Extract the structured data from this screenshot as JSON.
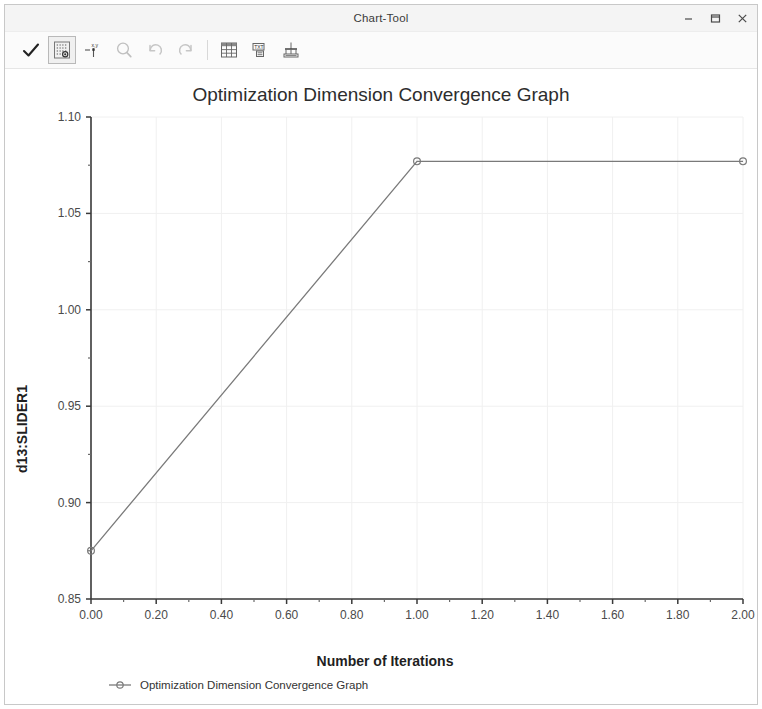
{
  "window": {
    "title": "Chart-Tool",
    "controls": [
      {
        "name": "minimize",
        "label": "–"
      },
      {
        "name": "maximize",
        "label": "❐"
      },
      {
        "name": "close",
        "label": "×"
      }
    ]
  },
  "toolbar": {
    "items": [
      {
        "name": "apply-check-icon",
        "tooltip": "Apply",
        "selected": false
      },
      {
        "name": "grid-points-icon",
        "tooltip": "Show Points",
        "selected": true
      },
      {
        "name": "xy-axes-icon",
        "tooltip": "X,Y Axes",
        "selected": false
      },
      {
        "name": "zoom-icon",
        "tooltip": "Zoom",
        "selected": false
      },
      {
        "name": "undo-icon",
        "tooltip": "Undo",
        "selected": false
      },
      {
        "name": "redo-icon",
        "tooltip": "Redo",
        "selected": false
      },
      {
        "name": "table-icon",
        "tooltip": "Table",
        "selected": false
      },
      {
        "name": "text-icon",
        "tooltip": "Text",
        "selected": false
      },
      {
        "name": "chart-export-icon",
        "tooltip": "Export Chart",
        "selected": false
      }
    ]
  },
  "chart_data": {
    "type": "line",
    "title": "Optimization Dimension Convergence Graph",
    "xlabel": "Number of Iterations",
    "ylabel": "d13:SLIDER1",
    "xlim": [
      0.0,
      2.0
    ],
    "ylim": [
      0.85,
      1.1
    ],
    "xticks": [
      "0.00",
      "0.20",
      "0.40",
      "0.60",
      "0.80",
      "1.00",
      "1.20",
      "1.40",
      "1.60",
      "1.80",
      "2.00"
    ],
    "xtick_values": [
      0.0,
      0.2,
      0.4,
      0.6,
      0.8,
      1.0,
      1.2,
      1.4,
      1.6,
      1.8,
      2.0
    ],
    "yticks": [
      "0.85",
      "0.90",
      "0.95",
      "1.00",
      "1.05",
      "1.10"
    ],
    "ytick_values": [
      0.85,
      0.9,
      0.95,
      1.0,
      1.05,
      1.1
    ],
    "grid": true,
    "legend_position": "bottom",
    "marker": "circle",
    "line_color": "#7a7a7a",
    "series": [
      {
        "name": "Optimization Dimension Convergence Graph",
        "x": [
          0.0,
          1.0,
          2.0
        ],
        "values": [
          0.875,
          1.077,
          1.077
        ]
      }
    ]
  },
  "legend": {
    "entries": [
      {
        "label": "Optimization Dimension Convergence Graph",
        "color": "#7a7a7a"
      }
    ]
  }
}
